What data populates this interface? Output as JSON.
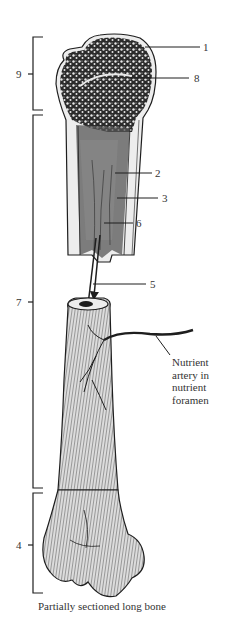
{
  "figure": {
    "caption": "Partially sectioned long bone",
    "colors": {
      "ink": "#1e1e1e",
      "bone_fill": "#dcdcdc",
      "cortex_fill": "#ededed",
      "spongy_fill": "#2a2a2a",
      "background": "#ffffff"
    },
    "brackets": [
      {
        "id": "9",
        "label": "9",
        "top": 37,
        "bottom": 110,
        "tick_y": 74
      },
      {
        "id": "7",
        "label": "7",
        "top": 115,
        "bottom": 488,
        "tick_y": 302
      },
      {
        "id": "4",
        "label": "4",
        "top": 493,
        "bottom": 593,
        "tick_y": 545
      }
    ],
    "callouts": [
      {
        "id": "1",
        "label": "1",
        "x": 203,
        "y": 42
      },
      {
        "id": "8",
        "label": "8",
        "x": 194,
        "y": 73
      },
      {
        "id": "2",
        "label": "2",
        "x": 155,
        "y": 168
      },
      {
        "id": "3",
        "label": "3",
        "x": 162,
        "y": 193
      },
      {
        "id": "6",
        "label": "6",
        "x": 136,
        "y": 218
      },
      {
        "id": "5",
        "label": "5",
        "x": 150,
        "y": 279
      }
    ],
    "nutrient_artery_label": {
      "lines": [
        "Nutrient",
        "artery in",
        "nutrient",
        "foramen"
      ]
    }
  }
}
